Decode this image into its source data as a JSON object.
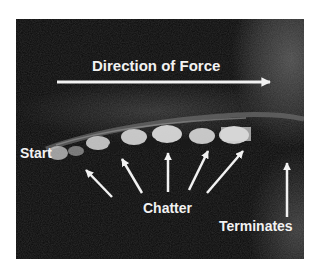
{
  "figure": {
    "labels": {
      "direction": "Direction of Force",
      "start": "Start",
      "chatter": "Chatter",
      "terminates": "Terminates"
    },
    "arrow_counts": {
      "direction_arrows": 1,
      "chatter_arrows": 5,
      "terminates_arrows": 1
    },
    "colors": {
      "background": "#ffffff",
      "photo_base": "#0a0a0a",
      "annotation": "#f2f2f2",
      "track_highlight": "#d9d9d9"
    }
  }
}
